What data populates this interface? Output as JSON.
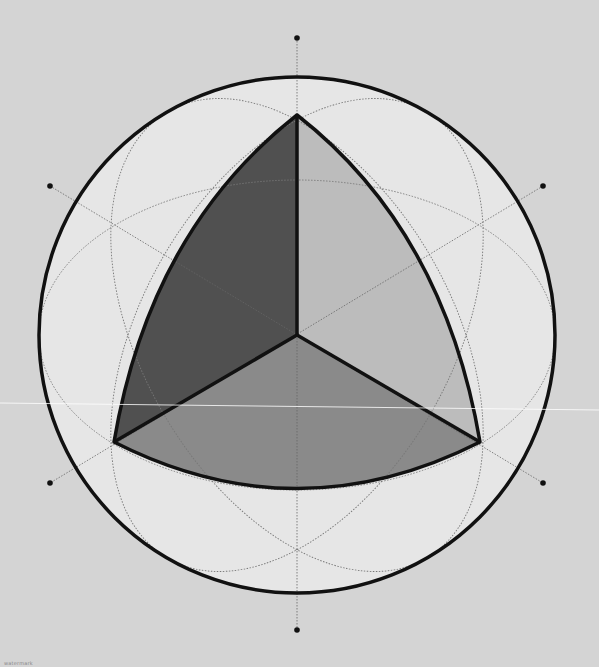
{
  "diagram": {
    "colors": {
      "background": "#d4d4d4",
      "sphere_fill": "#e6e6e6",
      "face_left": "#505050",
      "face_right": "#bcbcbc",
      "face_bottom": "#8a8a8a",
      "outline": "#111111",
      "guide": "#7a7a7a"
    },
    "sphere": {
      "cx": 297,
      "cy": 335,
      "r": 258
    },
    "vertices": {
      "top": [
        297,
        115
      ],
      "bottom_left": [
        114,
        442
      ],
      "bottom_right": [
        480,
        442
      ],
      "center": [
        297,
        335
      ]
    },
    "axis_points": [
      [
        297,
        38
      ],
      [
        297,
        630
      ],
      [
        50,
        186
      ],
      [
        543,
        186
      ],
      [
        50,
        483
      ],
      [
        543,
        483
      ]
    ],
    "caption": "watermark"
  }
}
